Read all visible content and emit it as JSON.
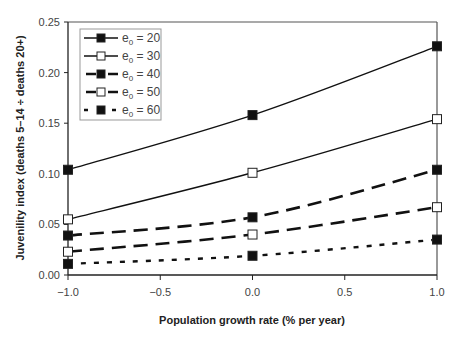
{
  "chart_data": {
    "type": "line",
    "title": "",
    "xlabel": "Population growth rate (% per year)",
    "ylabel": "Juvenility index (deaths 5–14 ÷ deaths 20+)",
    "x": [
      -1.0,
      0.0,
      1.0
    ],
    "xlim": [
      -1.0,
      1.0
    ],
    "ylim": [
      0.0,
      0.25
    ],
    "x_ticks": [
      "−1.0",
      "−0.5",
      "0.0",
      "0.5",
      "1.0"
    ],
    "y_ticks": [
      "0.00",
      "0.05",
      "0.10",
      "0.15",
      "0.20",
      "0.25"
    ],
    "grid": false,
    "legend_position": "upper-left-inside",
    "series": [
      {
        "name": "e0 = 20",
        "label_base": "e",
        "label_sub": "0",
        "label_rest": " = 20",
        "line": "solid-thin",
        "marker": "filled-square",
        "values": [
          0.104,
          0.158,
          0.226
        ]
      },
      {
        "name": "e0 = 30",
        "label_base": "e",
        "label_sub": "0",
        "label_rest": " = 30",
        "line": "solid-thin",
        "marker": "open-square",
        "values": [
          0.055,
          0.101,
          0.154
        ]
      },
      {
        "name": "e0 = 40",
        "label_base": "e",
        "label_sub": "0",
        "label_rest": " = 40",
        "line": "long-dash-thick",
        "marker": "filled-square",
        "values": [
          0.039,
          0.057,
          0.104
        ]
      },
      {
        "name": "e0 = 50",
        "label_base": "e",
        "label_sub": "0",
        "label_rest": " = 50",
        "line": "long-dash-thick",
        "marker": "open-square",
        "values": [
          0.023,
          0.04,
          0.067
        ]
      },
      {
        "name": "e0 = 60",
        "label_base": "e",
        "label_sub": "0",
        "label_rest": " = 60",
        "line": "short-dash",
        "marker": "filled-square",
        "values": [
          0.011,
          0.019,
          0.035
        ]
      }
    ]
  }
}
